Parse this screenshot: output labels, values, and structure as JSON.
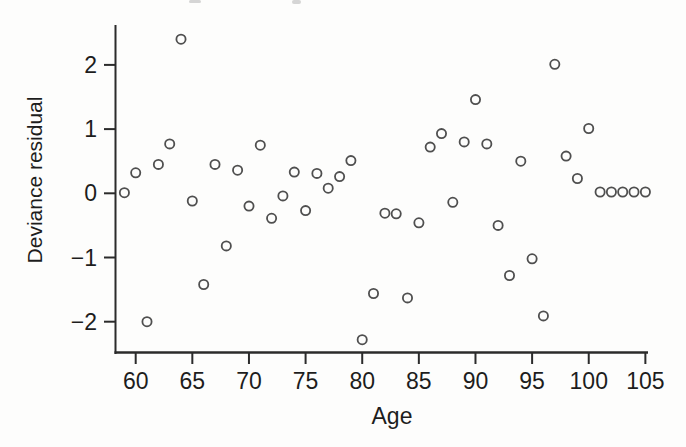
{
  "figure": {
    "background": "#fdfdfc"
  },
  "chart_data": {
    "type": "scatter",
    "title": "",
    "xlabel": "Age",
    "ylabel": "Deviance residual",
    "x_ticks": [
      60,
      65,
      70,
      75,
      80,
      85,
      90,
      95,
      100,
      105
    ],
    "x_tick_labels": [
      "60",
      "65",
      "70",
      "75",
      "80",
      "85",
      "90",
      "95",
      "100",
      "105"
    ],
    "y_ticks": [
      2,
      1,
      0,
      -1,
      -2
    ],
    "y_tick_labels": [
      "2",
      "1",
      "0",
      "−1",
      "−2"
    ],
    "xlim": [
      58.2,
      105.2
    ],
    "ylim": [
      -2.48,
      2.62
    ],
    "grid": false,
    "legend": null,
    "marker": "open-circle",
    "point_color": "#4f4f4f",
    "axis_color": "#2b2b2b",
    "text_color": "#1d1d1d",
    "points": [
      [
        59,
        0.01
      ],
      [
        60,
        0.32
      ],
      [
        61,
        -2.0
      ],
      [
        62,
        0.45
      ],
      [
        63,
        0.77
      ],
      [
        64,
        2.4
      ],
      [
        65,
        -0.12
      ],
      [
        66,
        -1.42
      ],
      [
        67,
        0.45
      ],
      [
        68,
        -0.82
      ],
      [
        69,
        0.36
      ],
      [
        70,
        -0.2
      ],
      [
        71,
        0.75
      ],
      [
        72,
        -0.39
      ],
      [
        73,
        -0.04
      ],
      [
        74,
        0.33
      ],
      [
        75,
        -0.27
      ],
      [
        76,
        0.31
      ],
      [
        77,
        0.08
      ],
      [
        78,
        0.26
      ],
      [
        79,
        0.51
      ],
      [
        80,
        -2.28
      ],
      [
        81,
        -1.56
      ],
      [
        82,
        -0.31
      ],
      [
        83,
        -0.32
      ],
      [
        84,
        -1.63
      ],
      [
        85,
        -0.46
      ],
      [
        86,
        0.72
      ],
      [
        87,
        0.93
      ],
      [
        88,
        -0.14
      ],
      [
        89,
        0.8
      ],
      [
        90,
        1.46
      ],
      [
        91,
        0.77
      ],
      [
        92,
        -0.5
      ],
      [
        93,
        -1.28
      ],
      [
        94,
        0.5
      ],
      [
        95,
        -1.02
      ],
      [
        96,
        -1.91
      ],
      [
        97,
        2.01
      ],
      [
        98,
        0.58
      ],
      [
        99,
        0.23
      ],
      [
        100,
        1.01
      ],
      [
        101,
        0.02
      ],
      [
        102,
        0.02
      ],
      [
        103,
        0.02
      ],
      [
        104,
        0.02
      ],
      [
        105,
        0.02
      ]
    ]
  }
}
